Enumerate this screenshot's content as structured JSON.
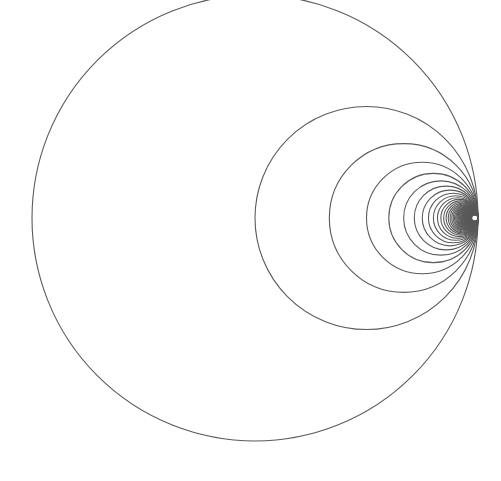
{
  "diagram": {
    "type": "tangent-circles",
    "canvas": {
      "width": 501,
      "height": 481,
      "background": "#ffffff"
    },
    "tangent_point": {
      "x": 478,
      "y": 218
    },
    "outer_diameter": 446,
    "circle_count": 70,
    "diameter_rule": "D/n for n = 1..N",
    "stroke_color": "#5a5a5a",
    "stroke_width": 1.1
  }
}
